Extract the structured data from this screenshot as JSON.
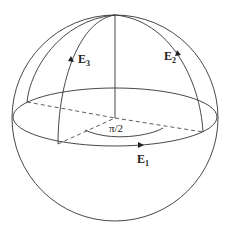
{
  "diagram": {
    "stroke_color": "#333333",
    "background": "#ffffff",
    "labels": {
      "e1": {
        "base": "E",
        "sub": "1"
      },
      "e2": {
        "base": "E",
        "sub": "2"
      },
      "e3": {
        "base": "E",
        "sub": "3"
      },
      "angle": "π/2"
    }
  }
}
